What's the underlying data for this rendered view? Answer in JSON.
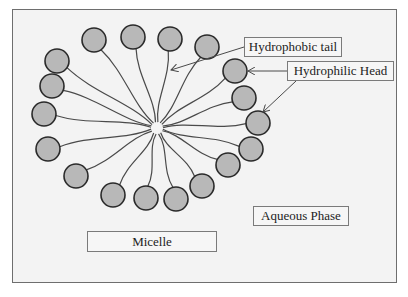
{
  "diagram": {
    "labels": {
      "hydrophobic_tail": "Hydrophobic tail",
      "hydrophilic_head": "Hydrophilic Head",
      "micelle": "Micelle",
      "aqueous_phase": "Aqueous Phase"
    },
    "colors": {
      "background": "#f3f3f3",
      "frame_border": "#6e6e6e",
      "head_fill": "#b8b8b8",
      "head_stroke": "#2a2a2a",
      "tail_stroke": "#4a4a4a"
    },
    "hub": {
      "x": 157,
      "y": 128
    },
    "head_radius": 12,
    "heads": [
      {
        "x": 94,
        "y": 40
      },
      {
        "x": 133,
        "y": 37
      },
      {
        "x": 170,
        "y": 39
      },
      {
        "x": 207,
        "y": 47
      },
      {
        "x": 235,
        "y": 71
      },
      {
        "x": 244,
        "y": 98
      },
      {
        "x": 258,
        "y": 123
      },
      {
        "x": 251,
        "y": 149
      },
      {
        "x": 228,
        "y": 165
      },
      {
        "x": 202,
        "y": 186
      },
      {
        "x": 176,
        "y": 199
      },
      {
        "x": 146,
        "y": 198
      },
      {
        "x": 113,
        "y": 195
      },
      {
        "x": 76,
        "y": 176
      },
      {
        "x": 48,
        "y": 149
      },
      {
        "x": 44,
        "y": 114
      },
      {
        "x": 52,
        "y": 86
      },
      {
        "x": 57,
        "y": 61
      }
    ],
    "arrows": [
      {
        "name": "hydrophobic-tail-arrow",
        "from": [
          244,
          47
        ],
        "to": [
          171,
          70
        ]
      },
      {
        "name": "hydrophilic-head-arrow-1",
        "from": [
          287,
          71
        ],
        "to": [
          248,
          71
        ]
      },
      {
        "name": "hydrophilic-head-arrow-2",
        "from": [
          296,
          81
        ],
        "to": [
          263,
          112
        ]
      }
    ]
  }
}
